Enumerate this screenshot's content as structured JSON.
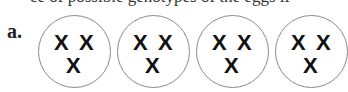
{
  "header": {
    "clipped_text": "ce of possible genotypes of the eggs if"
  },
  "figure": {
    "label": "a.",
    "cells": [
      {
        "chromosomes": [
          "X",
          "X",
          "X"
        ]
      },
      {
        "chromosomes": [
          "X",
          "X",
          "X"
        ]
      },
      {
        "chromosomes": [
          "X",
          "X",
          "X"
        ]
      },
      {
        "chromosomes": [
          "X",
          "X",
          "X"
        ]
      }
    ]
  }
}
